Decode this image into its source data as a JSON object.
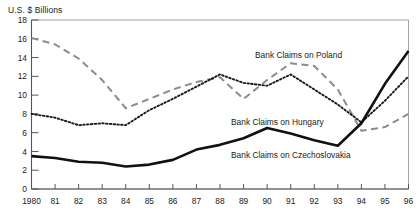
{
  "chart_data": {
    "type": "line",
    "title": "",
    "ylabel": "U.S. $ Billions",
    "xlabel": "",
    "ylim": [
      0,
      18
    ],
    "ytick_step": 2,
    "yticks": [
      "0",
      "2",
      "4",
      "6",
      "8",
      "10",
      "12",
      "14",
      "16",
      "18"
    ],
    "grid": false,
    "legend_position": "inline-annotations",
    "x": [
      1980,
      1981,
      1982,
      1983,
      1984,
      1985,
      1986,
      1987,
      1988,
      1989,
      1990,
      1991,
      1992,
      1993,
      1994,
      1995,
      1996
    ],
    "xtick_labels": [
      "1980",
      "81",
      "82",
      "83",
      "84",
      "85",
      "86",
      "87",
      "88",
      "89",
      "90",
      "91",
      "92",
      "93",
      "94",
      "95",
      "96"
    ],
    "series": [
      {
        "name": "Bank Claims on Poland",
        "style": "dashed",
        "color": "#8c8c8c",
        "values": [
          16.1,
          15.4,
          13.9,
          11.6,
          8.6,
          9.6,
          10.6,
          11.4,
          11.9,
          9.6,
          11.6,
          13.4,
          13.1,
          10.6,
          6.2,
          6.6,
          8.0
        ]
      },
      {
        "name": "Bank Claims on Hungary",
        "style": "dotted",
        "color": "#1a1a1a",
        "values": [
          8.0,
          7.6,
          6.8,
          7.0,
          6.8,
          8.4,
          9.6,
          10.9,
          12.2,
          11.3,
          11.0,
          12.2,
          10.6,
          9.0,
          7.1,
          9.4,
          12.0
        ]
      },
      {
        "name": "Bank Claims on Czechoslovakia",
        "style": "solid",
        "color": "#111111",
        "values": [
          3.5,
          3.3,
          2.9,
          2.8,
          2.4,
          2.6,
          3.1,
          4.2,
          4.7,
          5.4,
          6.5,
          5.9,
          5.2,
          4.6,
          7.0,
          11.2,
          14.7
        ]
      }
    ],
    "annotations": [
      {
        "text": "Bank Claims on Poland",
        "x_px": 255,
        "y_px": 58
      },
      {
        "text": "Bank Claims on Hungary",
        "x_px": 231,
        "y_px": 125
      },
      {
        "text": "Bank Claims on Czechoslovakia",
        "x_px": 231,
        "y_px": 158
      }
    ]
  },
  "axis": {
    "y_title": "U.S. $ Billions"
  }
}
